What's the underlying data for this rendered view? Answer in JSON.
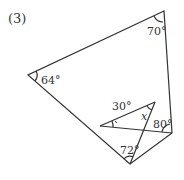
{
  "problem_label": "(3)",
  "angles": {
    "top_right": "70°",
    "left": "64°",
    "inner_30": "30°",
    "inner_x": "x",
    "right": "80°",
    "bottom": "72°"
  },
  "colors": {
    "line": "#333333"
  }
}
